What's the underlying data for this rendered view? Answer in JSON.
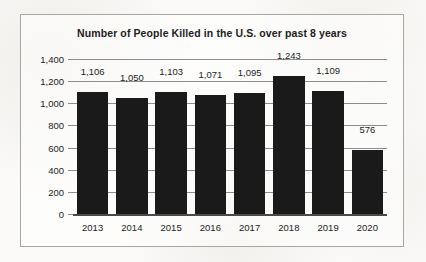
{
  "chart_data": {
    "type": "bar",
    "title": "Number of People Killed in the U.S. over past 8 years",
    "xlabel": "",
    "ylabel": "",
    "categories": [
      "2013",
      "2014",
      "2015",
      "2016",
      "2017",
      "2018",
      "2019",
      "2020"
    ],
    "values": [
      1106,
      1050,
      1103,
      1071,
      1095,
      1243,
      1109,
      576
    ],
    "value_labels": [
      "1,106",
      "1,050",
      "1,103",
      "1,071",
      "1,095",
      "1,243",
      "1,109",
      "576"
    ],
    "ylim": [
      0,
      1400
    ],
    "ytick_values": [
      0,
      200,
      400,
      600,
      800,
      1000,
      1200,
      1400
    ],
    "ytick_labels": [
      "0",
      "200",
      "400",
      "600",
      "800",
      "1,000",
      "1,200",
      "1,400"
    ],
    "grid": true,
    "legend": null,
    "bar_color": "#1a1a1a",
    "gridline_color": "#8d8d8d",
    "axis_color": "#4a4a4a",
    "text_color": "#1c1c1c",
    "background_color": "#fbfaf8",
    "border_color": "#a9a6a2"
  }
}
